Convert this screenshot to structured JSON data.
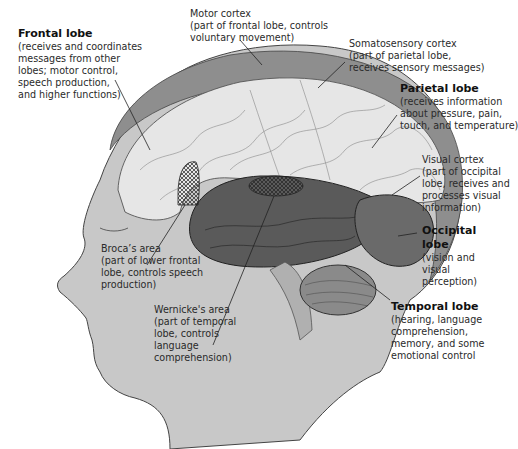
{
  "diagram": {
    "labels": {
      "frontal_lobe": {
        "title": "Frontal lobe",
        "lines": [
          "(receives and coordinates",
          "messages from other",
          "lobes; motor control,",
          "speech production,",
          "and higher functions)"
        ]
      },
      "motor_cortex": {
        "lines": [
          "Motor cortex",
          "(part of frontal lobe, controls",
          "voluntary movement)"
        ]
      },
      "somatosensory_cortex": {
        "lines": [
          "Somatosensory cortex",
          "(part of parietal lobe,",
          "receives sensory messages)"
        ]
      },
      "parietal_lobe": {
        "title": "Parietal lobe",
        "lines": [
          "(receives information",
          "about pressure, pain,",
          "touch, and temperature)"
        ]
      },
      "visual_cortex": {
        "lines": [
          "Visual cortex",
          "(part of occipital",
          "lobe, receives and",
          "processes visual",
          "information)"
        ]
      },
      "occipital_lobe": {
        "title": "Occipital",
        "title2": "lobe",
        "lines": [
          "(vision and",
          "visual",
          "perception)"
        ]
      },
      "temporal_lobe": {
        "title": "Temporal lobe",
        "lines": [
          "(hearing, language",
          "comprehension,",
          "memory, and some",
          "emotional control"
        ]
      },
      "brocas_area": {
        "lines": [
          "Broca’s area",
          "(part of lower frontal",
          "lobe, controls speech",
          "production)"
        ]
      },
      "wernickes_area": {
        "lines": [
          "Wernicke's area",
          "(part of temporal",
          "lobe, controls",
          "language",
          "comprehension)"
        ]
      }
    },
    "colors": {
      "head": "#c8c8c8",
      "hair": "#8e8e8e",
      "cortex": "#e6e6e6",
      "temporal": "#5a5a5a",
      "occipital": "#6a6a6a",
      "cerebellum": "#8a8a8a",
      "lines": "#222222"
    }
  }
}
